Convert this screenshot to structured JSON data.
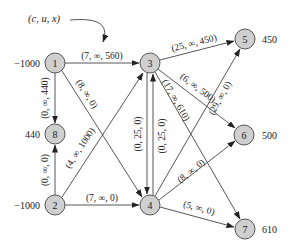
{
  "annotation": {
    "text": "(c, u, x)"
  },
  "nodes": [
    {
      "id": "1",
      "label": "1",
      "supply": "−1000"
    },
    {
      "id": "2",
      "label": "2",
      "supply": "−1000"
    },
    {
      "id": "3",
      "label": "3",
      "supply": ""
    },
    {
      "id": "4",
      "label": "4",
      "supply": ""
    },
    {
      "id": "5",
      "label": "5",
      "supply": "450"
    },
    {
      "id": "6",
      "label": "6",
      "supply": "500"
    },
    {
      "id": "7",
      "label": "7",
      "supply": "610"
    },
    {
      "id": "8",
      "label": "8",
      "supply": "440"
    }
  ],
  "edges": [
    {
      "from": "1",
      "to": "3",
      "label": "(7, ∞, 560)"
    },
    {
      "from": "1",
      "to": "4",
      "label": "(8, ∞, 0)"
    },
    {
      "from": "1",
      "to": "8",
      "label": "(0, ∞, 440)"
    },
    {
      "from": "2",
      "to": "8",
      "label": "(0, ∞, 0)"
    },
    {
      "from": "2",
      "to": "3",
      "label": "(4, ∞, 1000)"
    },
    {
      "from": "2",
      "to": "4",
      "label": "(7, ∞, 0)"
    },
    {
      "from": "3",
      "to": "4",
      "label": "(0, 25, 0)"
    },
    {
      "from": "4",
      "to": "3",
      "label": "(0, 25, 0)"
    },
    {
      "from": "3",
      "to": "5",
      "label": "(25, ∞, 450)"
    },
    {
      "from": "3",
      "to": "6",
      "label": "(6, ∞, 500)"
    },
    {
      "from": "3",
      "to": "7",
      "label": "(17, ∞, 610)"
    },
    {
      "from": "4",
      "to": "5",
      "label": "(29, ∞, 0)"
    },
    {
      "from": "4",
      "to": "6",
      "label": "(8, ∞, 0)"
    },
    {
      "from": "4",
      "to": "7",
      "label": "(5, ∞, 0)"
    }
  ]
}
